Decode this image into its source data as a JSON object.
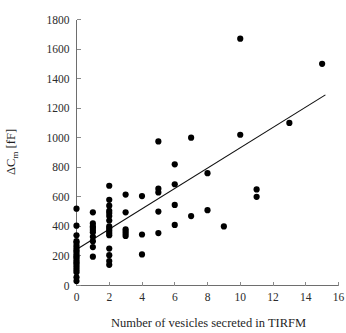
{
  "chart_data": {
    "type": "scatter",
    "title": "",
    "xlabel": "Number of vesicles secreted in TIRFM",
    "ylabel": "ΔCₘ [fF]",
    "ylabel_parts": {
      "delta": "Δ",
      "c": "C",
      "sub": "m",
      "unit": " [fF]"
    },
    "xlim": [
      0,
      16
    ],
    "ylim": [
      0,
      1800
    ],
    "xticks": [
      0,
      2,
      4,
      6,
      8,
      10,
      12,
      14,
      16
    ],
    "yticks": [
      0,
      200,
      400,
      600,
      800,
      1000,
      1200,
      1400,
      1600,
      1800
    ],
    "xtick_labels": [
      "0",
      "2",
      "4",
      "6",
      "8",
      "10",
      "12",
      "14",
      "16"
    ],
    "ytick_labels": [
      "0",
      "200",
      "400",
      "600",
      "800",
      "1000",
      "1200",
      "1400",
      "1600",
      "1800"
    ],
    "grid": false,
    "legend": null,
    "marker": "filled-circle",
    "marker_color": "#000000",
    "marker_size_px": 3.1,
    "points": [
      [
        0,
        30
      ],
      [
        0,
        55
      ],
      [
        0,
        90
      ],
      [
        0,
        105
      ],
      [
        0,
        120
      ],
      [
        0,
        135
      ],
      [
        0,
        150
      ],
      [
        0,
        160
      ],
      [
        0,
        175
      ],
      [
        0,
        190
      ],
      [
        0,
        200
      ],
      [
        0,
        215
      ],
      [
        0,
        230
      ],
      [
        0,
        240
      ],
      [
        0,
        255
      ],
      [
        0,
        270
      ],
      [
        0,
        290
      ],
      [
        0,
        300
      ],
      [
        0,
        340
      ],
      [
        0,
        405
      ],
      [
        0,
        520
      ],
      [
        1,
        195
      ],
      [
        1,
        260
      ],
      [
        1,
        300
      ],
      [
        1,
        330
      ],
      [
        1,
        360
      ],
      [
        1,
        375
      ],
      [
        1,
        390
      ],
      [
        1,
        400
      ],
      [
        1,
        420
      ],
      [
        1,
        495
      ],
      [
        2,
        140
      ],
      [
        2,
        165
      ],
      [
        2,
        205
      ],
      [
        2,
        250
      ],
      [
        2,
        340
      ],
      [
        2,
        355
      ],
      [
        2,
        370
      ],
      [
        2,
        385
      ],
      [
        2,
        400
      ],
      [
        2,
        440
      ],
      [
        2,
        470
      ],
      [
        2,
        490
      ],
      [
        2,
        505
      ],
      [
        2,
        540
      ],
      [
        2,
        580
      ],
      [
        2,
        675
      ],
      [
        3,
        335
      ],
      [
        3,
        350
      ],
      [
        3,
        365
      ],
      [
        3,
        380
      ],
      [
        3,
        495
      ],
      [
        3,
        615
      ],
      [
        4,
        210
      ],
      [
        4,
        345
      ],
      [
        4,
        605
      ],
      [
        5,
        355
      ],
      [
        5,
        500
      ],
      [
        5,
        630
      ],
      [
        5,
        655
      ],
      [
        5,
        975
      ],
      [
        6,
        410
      ],
      [
        6,
        545
      ],
      [
        6,
        685
      ],
      [
        6,
        820
      ],
      [
        7,
        470
      ],
      [
        7,
        1000
      ],
      [
        8,
        510
      ],
      [
        8,
        760
      ],
      [
        9,
        400
      ],
      [
        10,
        1020
      ],
      [
        10,
        1670
      ],
      [
        11,
        600
      ],
      [
        11,
        650
      ],
      [
        13,
        1100
      ],
      [
        15,
        1500
      ]
    ],
    "trend_line": {
      "type": "linear-regression",
      "x_start": 0.0,
      "y_start": 243,
      "x_end": 15.2,
      "y_end": 1290,
      "slope": 68.9,
      "intercept": 243,
      "color": "#111111"
    }
  }
}
